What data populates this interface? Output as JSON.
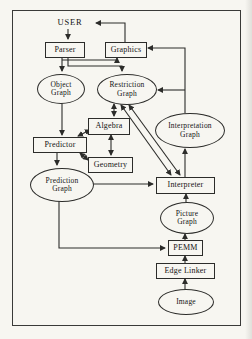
{
  "figure": {
    "caption_context": "System architecture block diagram (scanned book figure)",
    "colors": {
      "paper": "#f7f6f1",
      "line": "#2c2c2a",
      "text": "#141414",
      "frame": "#3a3a38"
    },
    "nodes": {
      "user": {
        "label": "USER",
        "shape": "text"
      },
      "parser": {
        "label": "Parser",
        "shape": "box"
      },
      "graphics": {
        "label": "Graphics",
        "shape": "box"
      },
      "object_graph": {
        "label": "Object Graph",
        "shape": "ellipse"
      },
      "restriction_graph": {
        "label": "Restriction Graph",
        "shape": "ellipse"
      },
      "algebra": {
        "label": "Algebra",
        "shape": "box"
      },
      "predictor": {
        "label": "Predictor",
        "shape": "box"
      },
      "geometry": {
        "label": "Geometry",
        "shape": "box"
      },
      "interpretation_graph": {
        "label": "Interpretation Graph",
        "shape": "ellipse"
      },
      "prediction_graph": {
        "label": "Prediction Graph",
        "shape": "ellipse"
      },
      "interpreter": {
        "label": "Interpreter",
        "shape": "box"
      },
      "picture_graph": {
        "label": "Picture Graph",
        "shape": "ellipse"
      },
      "pemm": {
        "label": "PEMM",
        "shape": "box"
      },
      "edge_linker": {
        "label": "Edge Linker",
        "shape": "box"
      },
      "image": {
        "label": "Image",
        "shape": "ellipse"
      }
    },
    "edges": [
      {
        "from": "user",
        "to": "parser",
        "bidirectional": false
      },
      {
        "from": "graphics",
        "to": "user",
        "bidirectional": false
      },
      {
        "from": "parser",
        "to": "object_graph",
        "bidirectional": false
      },
      {
        "from": "parser",
        "to": "graphics",
        "bidirectional": false
      },
      {
        "from": "parser",
        "to": "restriction_graph",
        "bidirectional": false
      },
      {
        "from": "interpretation_graph",
        "to": "graphics",
        "bidirectional": false
      },
      {
        "from": "interpretation_graph",
        "to": "restriction_graph",
        "bidirectional": false
      },
      {
        "from": "restriction_graph",
        "to": "algebra",
        "bidirectional": true
      },
      {
        "from": "restriction_graph",
        "to": "interpreter",
        "bidirectional": true
      },
      {
        "from": "restriction_graph",
        "to": "interpreter",
        "bidirectional": true
      },
      {
        "from": "object_graph",
        "to": "predictor",
        "bidirectional": false
      },
      {
        "from": "predictor",
        "to": "algebra",
        "bidirectional": true
      },
      {
        "from": "algebra",
        "to": "geometry",
        "bidirectional": true
      },
      {
        "from": "predictor",
        "to": "geometry",
        "bidirectional": true
      },
      {
        "from": "predictor",
        "to": "prediction_graph",
        "bidirectional": false
      },
      {
        "from": "prediction_graph",
        "to": "interpreter",
        "bidirectional": false
      },
      {
        "from": "interpreter",
        "to": "interpretation_graph",
        "bidirectional": false
      },
      {
        "from": "picture_graph",
        "to": "interpreter",
        "bidirectional": false
      },
      {
        "from": "pemm",
        "to": "picture_graph",
        "bidirectional": false
      },
      {
        "from": "edge_linker",
        "to": "pemm",
        "bidirectional": false
      },
      {
        "from": "image",
        "to": "edge_linker",
        "bidirectional": false
      },
      {
        "from": "prediction_graph",
        "to": "pemm",
        "bidirectional": false
      }
    ]
  }
}
